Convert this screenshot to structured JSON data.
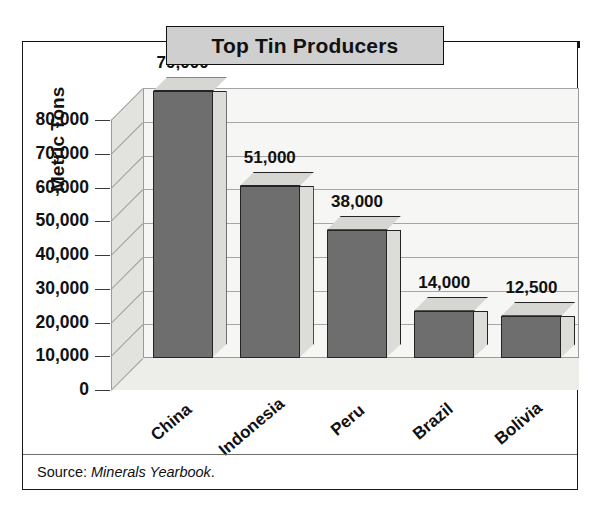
{
  "title": "Top Tin Producers",
  "source": {
    "prefix": "Source:",
    "work": "Minerals Yearbook",
    "suffix": "."
  },
  "chart_data": {
    "type": "bar",
    "title": "Top Tin Producers",
    "xlabel": "",
    "ylabel": "Metric Tons",
    "categories": [
      "China",
      "Indonesia",
      "Peru",
      "Brazil",
      "Bolivia"
    ],
    "values": [
      79000,
      51000,
      38000,
      14000,
      12500
    ],
    "value_labels": [
      "79,000",
      "51,000",
      "38,000",
      "14,000",
      "12,500"
    ],
    "ylim": [
      0,
      80000
    ],
    "ytick_values": [
      0,
      10000,
      20000,
      30000,
      40000,
      50000,
      60000,
      70000,
      80000
    ],
    "ytick_labels": [
      "0",
      "10,000",
      "20,000",
      "30,000",
      "40,000",
      "50,000",
      "60,000",
      "70,000",
      "80,000"
    ],
    "grid": true,
    "legend": null,
    "style": "3d-column",
    "colors": {
      "bar_front": "#6e6e6e",
      "bar_top": "#d6d6d2",
      "bar_side": "#dcdcd8",
      "back_wall": "#f6f6f4",
      "side_wall": "#e2e2de",
      "floor": "#ededea",
      "gridline": "#a6a6a6",
      "outline": "#242424",
      "title_plaque": "#cfcfcf",
      "rule": "#111111",
      "text": "#111111"
    }
  }
}
